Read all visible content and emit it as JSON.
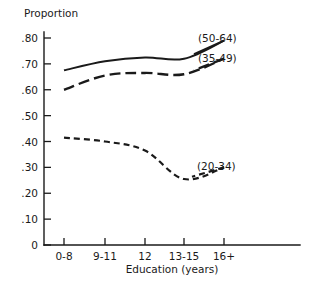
{
  "chart_data": {
    "type": "line",
    "title": "",
    "ylabel": "Proportion",
    "xlabel": "Education (years)",
    "categories": [
      "0-8",
      "9-11",
      "12",
      "13-15",
      "16+"
    ],
    "ytick_labels": [
      ".80",
      ".70",
      ".60",
      ".50",
      ".40",
      ".30",
      ".20",
      ".10",
      "0"
    ],
    "ytick_values": [
      0.8,
      0.7,
      0.6,
      0.5,
      0.4,
      0.3,
      0.2,
      0.1,
      0
    ],
    "ylim": [
      0,
      0.85
    ],
    "grid": false,
    "legend_position": "inline-right",
    "series": [
      {
        "name": "(50-64)",
        "label": "(50-64)",
        "style": "solid",
        "values": [
          0.675,
          0.71,
          0.725,
          0.72,
          0.79
        ]
      },
      {
        "name": "(35-49)",
        "label": "(35-49)",
        "style": "long-dashed",
        "values": [
          0.6,
          0.655,
          0.665,
          0.66,
          0.72
        ]
      },
      {
        "name": "(20-34)",
        "label": "(20-34)",
        "style": "short-dashed",
        "values": [
          0.415,
          0.4,
          0.365,
          0.255,
          0.3
        ]
      }
    ],
    "colors": {
      "ink": "#1a1a1a",
      "background": "#ffffff"
    }
  }
}
